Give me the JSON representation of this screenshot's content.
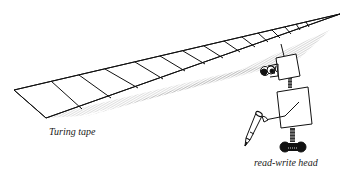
{
  "figure": {
    "labels": {
      "tape": "Turing tape",
      "head": "read-write head"
    },
    "colors": {
      "ink": "#111111",
      "shade": "#555555",
      "background": "#ffffff"
    }
  }
}
